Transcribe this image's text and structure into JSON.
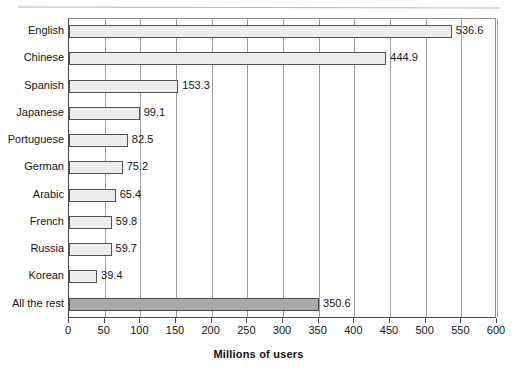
{
  "chart_data": {
    "type": "bar",
    "orientation": "horizontal",
    "title": "",
    "xlabel": "Millions of users",
    "ylabel": "",
    "xlim": [
      0,
      600
    ],
    "xticks": [
      0,
      50,
      100,
      150,
      200,
      250,
      300,
      350,
      400,
      450,
      500,
      550,
      600
    ],
    "grid": true,
    "legend": null,
    "categories": [
      "English",
      "Chinese",
      "Spanish",
      "Japanese",
      "Portuguese",
      "German",
      "Arabic",
      "French",
      "Russia",
      "Korean",
      "All the rest"
    ],
    "values": [
      536.6,
      444.9,
      153.3,
      99.1,
      82.5,
      75.2,
      65.4,
      59.8,
      59.7,
      39.4,
      350.6
    ],
    "value_labels": [
      "536.6",
      "444.9",
      "153.3",
      "99.1",
      "82.5",
      "75.2",
      "65.4",
      "59.8",
      "59.7",
      "39.4",
      "350.6"
    ],
    "bar_colors": [
      "#ededed",
      "#ededed",
      "#ededed",
      "#ededed",
      "#ededed",
      "#ededed",
      "#ededed",
      "#ededed",
      "#ededed",
      "#ededed",
      "#a9a9a9"
    ],
    "bar_border_color": "#535353",
    "gridline_color": "#9d9d9d",
    "axis_color": "#4a4a4a"
  },
  "axis": {
    "x_tick_labels": [
      "0",
      "50",
      "100",
      "150",
      "200",
      "250",
      "300",
      "350",
      "400",
      "450",
      "500",
      "550",
      "600"
    ],
    "x_title": "Millions of users"
  },
  "artifacts": {
    "cropped_title_fragment": ""
  }
}
